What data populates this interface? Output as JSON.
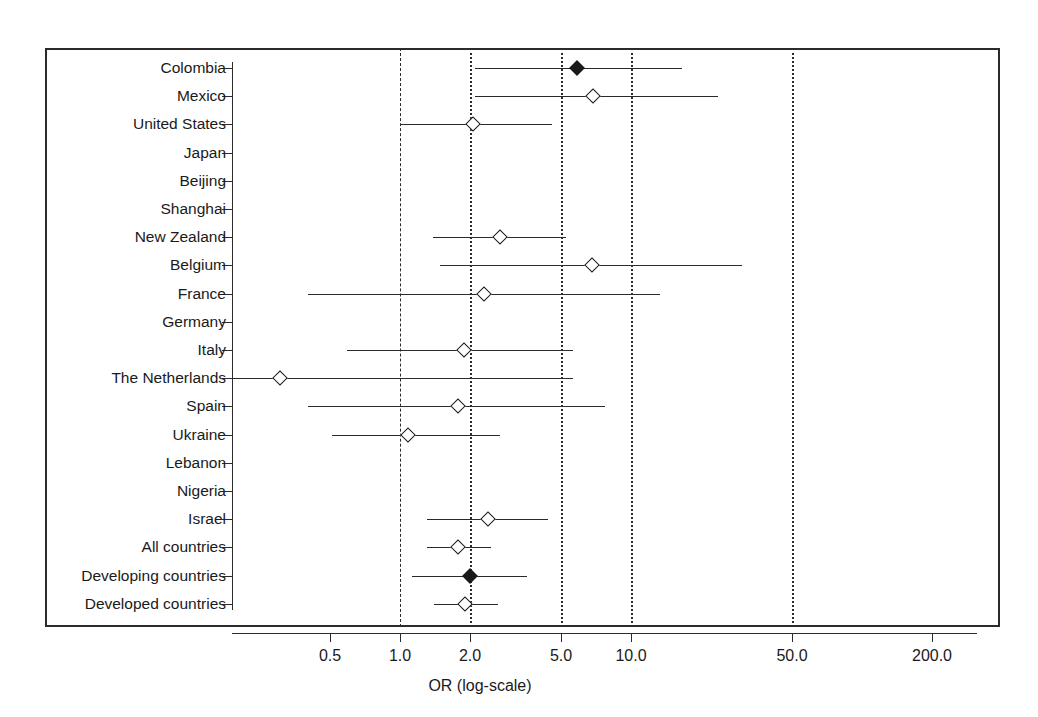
{
  "chart_data": {
    "type": "scatter",
    "subtype": "forest-plot",
    "title": "",
    "xlabel": "OR (log-scale)",
    "ylabel": "",
    "xscale": "log",
    "xlim": [
      0.35,
      300.0
    ],
    "grid": false,
    "legend": null,
    "x_ticks": [
      {
        "value": 0.5,
        "label": "0.5",
        "px": 330
      },
      {
        "value": 1.0,
        "label": "1.0",
        "px": 400
      },
      {
        "value": 2.0,
        "label": "2.0",
        "px": 470
      },
      {
        "value": 5.0,
        "label": "5.0",
        "px": 561
      },
      {
        "value": 10.0,
        "label": "10.0",
        "px": 631
      },
      {
        "value": 50.0,
        "label": "50.0",
        "px": 792
      },
      {
        "value": 200.0,
        "label": "200.0",
        "px": 932
      }
    ],
    "reference_lines": [
      {
        "value": 1.0,
        "style": "dashed",
        "px": 400
      },
      {
        "value": 2.0,
        "style": "dotted",
        "px": 470
      },
      {
        "value": 5.0,
        "style": "dotted",
        "px": 561
      },
      {
        "value": 10.0,
        "style": "dotted",
        "px": 631
      },
      {
        "value": 50.0,
        "style": "dotted",
        "px": 792
      }
    ],
    "categories": [
      "Colombia",
      "Mexico",
      "United States",
      "Japan",
      "Beijing",
      "Shanghai",
      "New Zealand",
      "Belgium",
      "France",
      "Germany",
      "Italy",
      "The Netherlands",
      "Spain",
      "Ukraine",
      "Lebanon",
      "Nigeria",
      "Israel",
      "All countries",
      "Developing countries",
      "Developed countries"
    ],
    "rows": [
      {
        "label": "Colombia",
        "or": 6.7,
        "ci_low": 2.1,
        "ci_high": 16.0,
        "marker": "filled",
        "has_data": true,
        "px_pt": 577,
        "px_lo": 475,
        "px_hi": 682
      },
      {
        "label": "Mexico",
        "or": 7.6,
        "ci_low": 2.1,
        "ci_high": 24.0,
        "marker": "open",
        "has_data": true,
        "px_pt": 593,
        "px_lo": 475,
        "px_hi": 718
      },
      {
        "label": "United States",
        "or": 2.1,
        "ci_low": 1.0,
        "ci_high": 4.4,
        "marker": "open",
        "has_data": true,
        "px_pt": 473,
        "px_lo": 400,
        "px_hi": 552
      },
      {
        "label": "Japan",
        "or": null,
        "ci_low": null,
        "ci_high": null,
        "marker": null,
        "has_data": false,
        "px_pt": null,
        "px_lo": null,
        "px_hi": null
      },
      {
        "label": "Beijing",
        "or": null,
        "ci_low": null,
        "ci_high": null,
        "marker": null,
        "has_data": false,
        "px_pt": null,
        "px_lo": null,
        "px_hi": null
      },
      {
        "label": "Shanghai",
        "or": null,
        "ci_low": null,
        "ci_high": null,
        "marker": null,
        "has_data": false,
        "px_pt": null,
        "px_lo": null,
        "px_hi": null
      },
      {
        "label": "New Zealand",
        "or": 2.7,
        "ci_low": 1.4,
        "ci_high": 5.2,
        "marker": "open",
        "has_data": true,
        "px_pt": 500,
        "px_lo": 433,
        "px_hi": 566
      },
      {
        "label": "Belgium",
        "or": 7.4,
        "ci_low": 1.5,
        "ci_high": 33.0,
        "marker": "open",
        "has_data": true,
        "px_pt": 592,
        "px_lo": 440,
        "px_hi": 742
      },
      {
        "label": "France",
        "or": 2.3,
        "ci_low": 0.4,
        "ci_high": 13.0,
        "marker": "open",
        "has_data": true,
        "px_pt": 484,
        "px_lo": 308,
        "px_hi": 660
      },
      {
        "label": "Germany",
        "or": null,
        "ci_low": null,
        "ci_high": null,
        "marker": null,
        "has_data": false,
        "px_pt": null,
        "px_lo": null,
        "px_hi": null
      },
      {
        "label": "Italy",
        "or": 1.9,
        "ci_low": 0.6,
        "ci_high": 5.7,
        "marker": "open",
        "has_data": true,
        "px_pt": 464,
        "px_lo": 347,
        "px_hi": 573
      },
      {
        "label": "The Netherlands",
        "or": 0.3,
        "ci_low": 0.3,
        "ci_high": 5.7,
        "marker": "open",
        "has_data": true,
        "px_pt": 280,
        "px_lo": 232,
        "px_hi": 573
      },
      {
        "label": "Spain",
        "or": 1.8,
        "ci_low": 0.4,
        "ci_high": 7.5,
        "marker": "open",
        "has_data": true,
        "px_pt": 458,
        "px_lo": 308,
        "px_hi": 605
      },
      {
        "label": "Ukraine",
        "or": 1.1,
        "ci_low": 0.5,
        "ci_high": 2.7,
        "marker": "open",
        "has_data": true,
        "px_pt": 408,
        "px_lo": 332,
        "px_hi": 500
      },
      {
        "label": "Lebanon",
        "or": null,
        "ci_low": null,
        "ci_high": null,
        "marker": null,
        "has_data": false,
        "px_pt": null,
        "px_lo": null,
        "px_hi": null
      },
      {
        "label": "Nigeria",
        "or": null,
        "ci_low": null,
        "ci_high": null,
        "marker": null,
        "has_data": false,
        "px_pt": null,
        "px_lo": null,
        "px_hi": null
      },
      {
        "label": "Israel",
        "or": 2.4,
        "ci_low": 1.3,
        "ci_high": 4.3,
        "marker": "open",
        "has_data": true,
        "px_pt": 488,
        "px_lo": 427,
        "px_hi": 548
      },
      {
        "label": "All countries",
        "or": 1.8,
        "ci_low": 1.3,
        "ci_high": 2.5,
        "marker": "open",
        "has_data": true,
        "px_pt": 458,
        "px_lo": 427,
        "px_hi": 491
      },
      {
        "label": "Developing countries",
        "or": 2.0,
        "ci_low": 1.1,
        "ci_high": 3.3,
        "marker": "filled",
        "has_data": true,
        "px_pt": 470,
        "px_lo": 412,
        "px_hi": 527
      },
      {
        "label": "Developed countries",
        "or": 1.9,
        "ci_low": 1.4,
        "ci_high": 2.6,
        "marker": "open",
        "has_data": true,
        "px_pt": 465,
        "px_lo": 434,
        "px_hi": 498
      }
    ]
  },
  "colors": {
    "axis": "#2b2b2b",
    "marker": "#1a1a1a",
    "background": "#ffffff"
  }
}
